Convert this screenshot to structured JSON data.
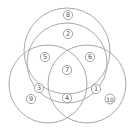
{
  "diagram": {
    "type": "venn",
    "stroke_color": "#a9a9a9",
    "label_color": "#555555",
    "circles": [
      {
        "name": "outer-top",
        "cx": 67,
        "cy": 51,
        "r": 43
      },
      {
        "name": "inner-top",
        "cx": 67,
        "cy": 63,
        "r": 40
      },
      {
        "name": "left",
        "cx": 48,
        "cy": 84,
        "r": 39
      },
      {
        "name": "right",
        "cx": 87,
        "cy": 84,
        "r": 39
      }
    ],
    "regions": [
      {
        "label": "8",
        "x": 68,
        "y": 15
      },
      {
        "label": "2",
        "x": 68,
        "y": 34
      },
      {
        "label": "5",
        "x": 45,
        "y": 57
      },
      {
        "label": "6",
        "x": 90,
        "y": 57
      },
      {
        "label": "7",
        "x": 67,
        "y": 70
      },
      {
        "label": "3",
        "x": 39,
        "y": 88
      },
      {
        "label": "1",
        "x": 96,
        "y": 89
      },
      {
        "label": "9",
        "x": 31,
        "y": 99
      },
      {
        "label": "4",
        "x": 67,
        "y": 98
      },
      {
        "label": "10",
        "x": 110,
        "y": 99
      }
    ]
  }
}
